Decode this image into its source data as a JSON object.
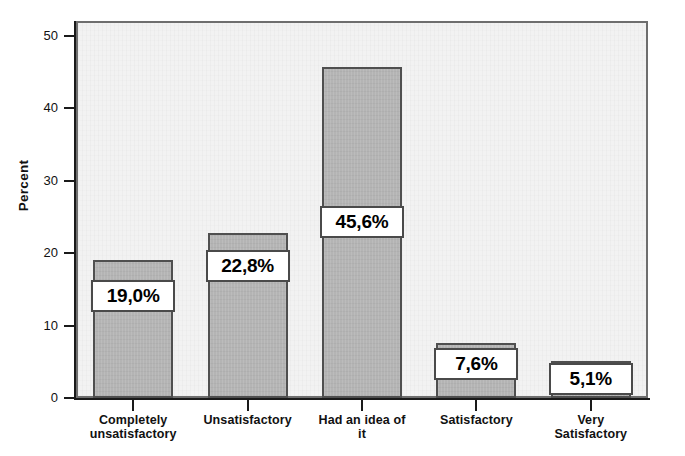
{
  "chart_data": {
    "type": "bar",
    "title": "",
    "subtitle": "",
    "xlabel": "",
    "ylabel": "Percent",
    "ylim": [
      0,
      52
    ],
    "yticks": [
      0,
      10,
      20,
      30,
      40,
      50
    ],
    "ytick_labels": [
      "0",
      "10",
      "20",
      "30",
      "40",
      "50"
    ],
    "grid": false,
    "legend": false,
    "decimal_separator": ",",
    "categories": [
      "Completely unsatisfactory",
      "Unsatisfactory",
      "Had an idea of it",
      "Satisfactory",
      "Very Satisfactory"
    ],
    "category_label_lines": [
      [
        "Completely",
        "unsatisfactory"
      ],
      [
        "Unsatisfactory"
      ],
      [
        "Had an idea of",
        "it"
      ],
      [
        "Satisfactory"
      ],
      [
        "Very",
        "Satisfactory"
      ]
    ],
    "values": [
      19.0,
      22.8,
      45.6,
      7.6,
      5.1
    ],
    "data_labels": [
      "19,0%",
      "22,8%",
      "45,6%",
      "7,6%",
      "5,1%"
    ],
    "colors": {
      "bar_fill": "#b4b4b4",
      "bar_border": "#4f4f4f",
      "panel_background": "#f2f2f2",
      "panel_border": "#6e6e6e",
      "axis": "#1a1a1a",
      "label_box_background": "#ffffff",
      "label_box_border": "#4a4a4a",
      "text": "#111111"
    }
  }
}
